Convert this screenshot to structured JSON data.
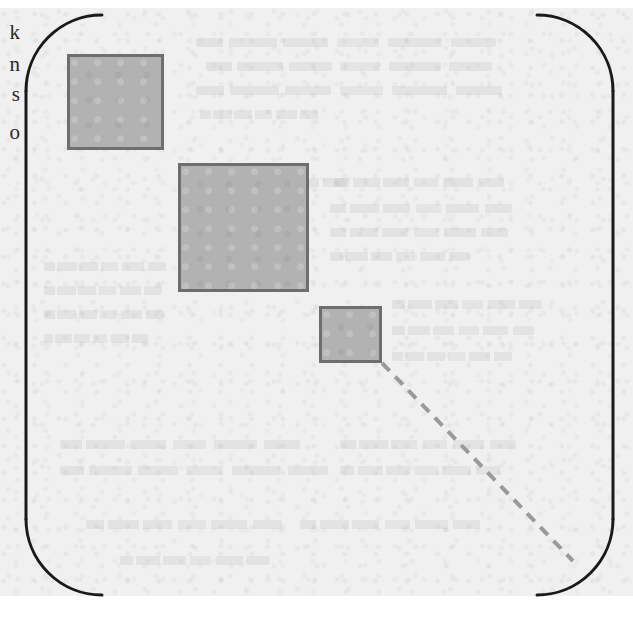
{
  "figure": {
    "kind": "scanned-book-figure",
    "canvas": {
      "width": 633,
      "height": 624
    },
    "colors": {
      "paper": "#f0f0f0",
      "outer_paper": "#ffffff",
      "ink": "#1a1a1a",
      "square_fill": "#b2b2b2",
      "square_border": "#6e6e6e",
      "dashed_line": "#9a9a9a",
      "ghost_text": "#8c8c96"
    },
    "rounded_rect": {
      "name": "enclosure-boundary",
      "left": 26,
      "top": 15,
      "right": 613,
      "bottom": 595,
      "corner_radius": 76,
      "stroke_width": 3,
      "edges_drawn": {
        "left": true,
        "right": true,
        "top": false,
        "bottom": false
      },
      "note": "Top and bottom straight edges are absent in the scan; only the four corner arcs and the two vertical sides are inked."
    },
    "squares": [
      {
        "name": "square-large-upper-left",
        "x": 67,
        "y": 54,
        "width": 97,
        "height": 96
      },
      {
        "name": "square-largest-middle",
        "x": 178,
        "y": 163,
        "width": 131,
        "height": 129
      },
      {
        "name": "square-small-lower",
        "x": 319,
        "y": 306,
        "width": 63,
        "height": 57
      }
    ],
    "dashed_line": {
      "name": "dashed-diagonal",
      "x1": 382,
      "y1": 363,
      "x2": 573,
      "y2": 561,
      "dash_length": 11,
      "gap_length": 8,
      "stroke_width": 4
    }
  },
  "margin_text": {
    "note": "Serif body-text letters clipped by the left edge of the crop",
    "letters": [
      {
        "glyph": "k",
        "top": 22
      },
      {
        "glyph": "n",
        "top": 54
      },
      {
        "glyph": "s",
        "top": 84
      },
      {
        "glyph": "o",
        "top": 122
      }
    ]
  },
  "ghost_text": {
    "note": "Illegible bleed-through text from the reverse side of the page",
    "lines": [
      {
        "left": 196,
        "top": 38,
        "width": 300
      },
      {
        "left": 206,
        "top": 62,
        "width": 286
      },
      {
        "left": 196,
        "top": 86,
        "width": 306
      },
      {
        "left": 200,
        "top": 110,
        "width": 118
      },
      {
        "left": 196,
        "top": 178,
        "width": 150
      },
      {
        "left": 334,
        "top": 178,
        "width": 170
      },
      {
        "left": 330,
        "top": 204,
        "width": 182
      },
      {
        "left": 330,
        "top": 228,
        "width": 178
      },
      {
        "left": 330,
        "top": 252,
        "width": 140
      },
      {
        "left": 44,
        "top": 262,
        "width": 122
      },
      {
        "left": 44,
        "top": 286,
        "width": 118
      },
      {
        "left": 44,
        "top": 310,
        "width": 120
      },
      {
        "left": 44,
        "top": 334,
        "width": 104
      },
      {
        "left": 392,
        "top": 300,
        "width": 150
      },
      {
        "left": 392,
        "top": 326,
        "width": 142
      },
      {
        "left": 392,
        "top": 352,
        "width": 120
      },
      {
        "left": 60,
        "top": 440,
        "width": 240
      },
      {
        "left": 60,
        "top": 466,
        "width": 268
      },
      {
        "left": 340,
        "top": 440,
        "width": 176
      },
      {
        "left": 340,
        "top": 466,
        "width": 160
      },
      {
        "left": 86,
        "top": 520,
        "width": 196
      },
      {
        "left": 300,
        "top": 520,
        "width": 180
      },
      {
        "left": 120,
        "top": 556,
        "width": 150
      }
    ]
  }
}
